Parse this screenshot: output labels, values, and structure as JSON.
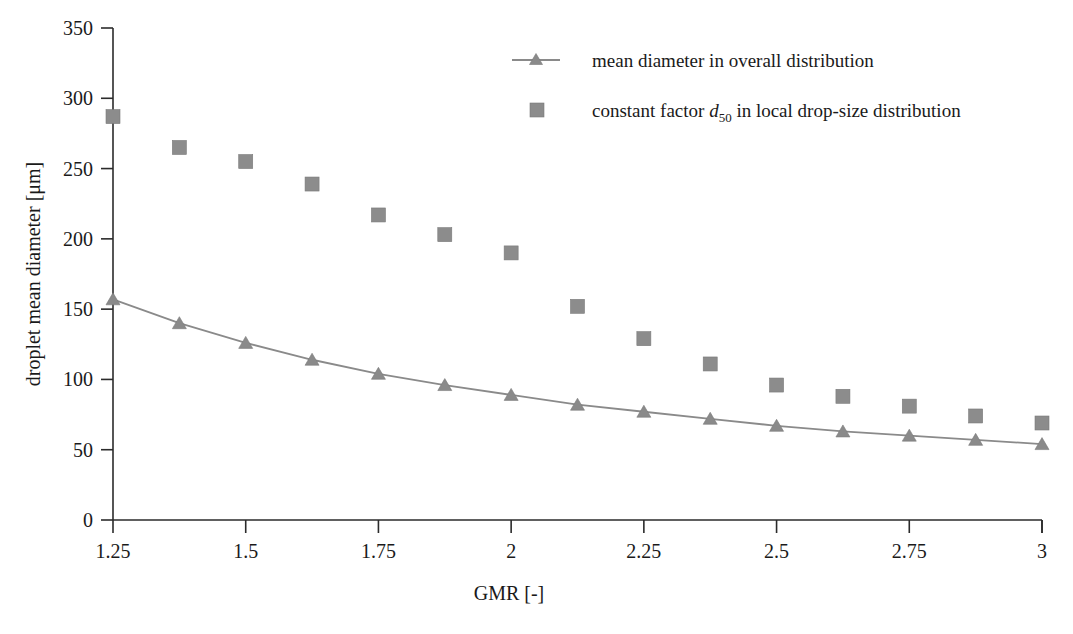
{
  "chart_data": {
    "type": "scatter",
    "title": "",
    "xlabel": "GMR [-]",
    "ylabel": "droplet mean diameter [μm]",
    "xlim": [
      1.25,
      3
    ],
    "ylim": [
      0,
      350
    ],
    "xticks": [
      "1.25",
      "1.5",
      "1.75",
      "2",
      "2.25",
      "2.5",
      "2.75",
      "3"
    ],
    "xtick_values": [
      1.25,
      1.5,
      1.75,
      2,
      2.25,
      2.5,
      2.75,
      3
    ],
    "yticks": [
      "0",
      "50",
      "100",
      "150",
      "200",
      "250",
      "300",
      "350"
    ],
    "ytick_values": [
      0,
      50,
      100,
      150,
      200,
      250,
      300,
      350
    ],
    "grid": false,
    "legend_position": "top-right",
    "x": [
      1.25,
      1.375,
      1.5,
      1.625,
      1.75,
      1.875,
      2.0,
      2.125,
      2.25,
      2.375,
      2.5,
      2.625,
      2.75,
      2.875,
      3.0
    ],
    "series": [
      {
        "name": "mean diameter in overall distribution",
        "marker": "triangle",
        "line": true,
        "color": "#8a8a8a",
        "values": [
          157,
          140,
          126,
          114,
          104,
          96,
          89,
          82,
          77,
          72,
          67,
          63,
          60,
          57,
          54
        ]
      },
      {
        "name": "constant factor d50 in local drop-size distribution",
        "marker": "square",
        "line": false,
        "color": "#8c8c8c",
        "values": [
          287,
          265,
          255,
          239,
          217,
          203,
          190,
          152,
          129,
          111,
          96,
          88,
          81,
          74,
          69
        ]
      }
    ]
  },
  "legend": {
    "items": [
      {
        "label": "mean diameter in overall distribution",
        "marker": "line-triangle"
      },
      {
        "label_pre": "constant factor ",
        "label_sym": "d",
        "label_sub": "50",
        "label_post": " in local drop-size distribution",
        "marker": "square"
      }
    ]
  },
  "axes": {
    "x_title": "GMR [-]",
    "y_title": "droplet mean diameter [μm]"
  },
  "caption": {
    "stub": ""
  },
  "colors": {
    "marker_gray": "#8c8c8c",
    "line_gray": "#8a8a8a",
    "axis_black": "#2b2b2b",
    "text_black": "#1a1a1a",
    "background": "#ffffff"
  }
}
